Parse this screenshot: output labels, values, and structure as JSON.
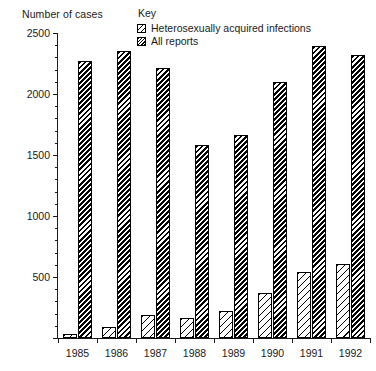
{
  "axis_title": "Number of cases",
  "legend": {
    "title": "Key",
    "entries": [
      {
        "label": "Heterosexually acquired infections",
        "pattern": "light-diagonal-hatch"
      },
      {
        "label": "All reports",
        "pattern": "dense-diagonal-hatch"
      }
    ]
  },
  "y_ticks": [
    "0",
    "500",
    "1000",
    "1500",
    "2000",
    "2500"
  ],
  "y_major_labels": [
    "500",
    "1000",
    "1500",
    "2000",
    "2500"
  ],
  "chart_data": {
    "type": "bar",
    "title": "",
    "subtitle": "",
    "xlabel": "",
    "ylabel": "Number of cases",
    "ylim": [
      0,
      2500
    ],
    "ytick_values": [
      0,
      500,
      1000,
      1500,
      2000,
      2500
    ],
    "ytick_labels": [
      "",
      "500",
      "1000",
      "1500",
      "2000",
      "2500"
    ],
    "y_minor_tick_interval": 100,
    "grid": false,
    "legend_position": "top-center",
    "legend_title": "Key",
    "categories": [
      "1985",
      "1986",
      "1987",
      "1988",
      "1989",
      "1990",
      "1991",
      "1992"
    ],
    "series": [
      {
        "name": "Heterosexually acquired infections",
        "values": [
          30,
          90,
          185,
          160,
          225,
          370,
          540,
          610
        ]
      },
      {
        "name": "All reports",
        "values": [
          2270,
          2355,
          2210,
          1585,
          1660,
          2100,
          2390,
          2320
        ]
      }
    ]
  }
}
